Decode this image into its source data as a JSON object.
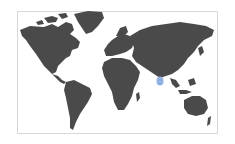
{
  "map": {
    "type": "world-choropleth",
    "land_color": "#4a4a4a",
    "background_color": "#ffffff",
    "border_color": "#d8d8d8",
    "highlighted_regions": [
      {
        "name": "Sri Lanka",
        "color": "#8fb0e0"
      }
    ],
    "continents": [
      "North America",
      "South America",
      "Greenland",
      "Europe",
      "Africa",
      "Asia",
      "Australia"
    ]
  }
}
